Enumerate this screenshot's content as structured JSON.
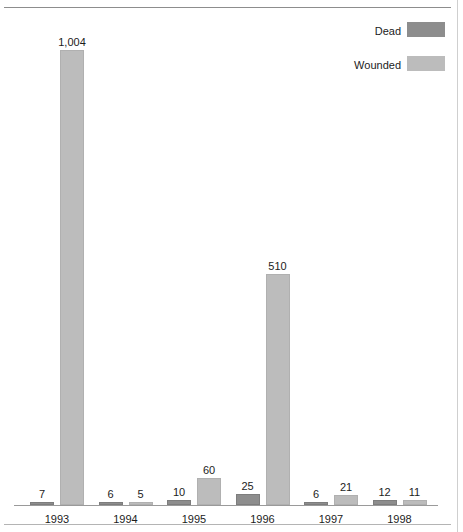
{
  "chart_data": {
    "type": "bar",
    "title": "",
    "xlabel": "",
    "ylabel": "",
    "grid": false,
    "legend_position": "top-right",
    "ylim": [
      0,
      1004
    ],
    "categories": [
      "1993",
      "1994",
      "1995",
      "1996",
      "1997",
      "1998"
    ],
    "series": [
      {
        "name": "Dead",
        "color": "#8d8d8d",
        "values": [
          7,
          6,
          10,
          25,
          6,
          12
        ],
        "labels": [
          "7",
          "6",
          "10",
          "25",
          "6",
          "12"
        ]
      },
      {
        "name": "Wounded",
        "color": "#bcbcbc",
        "values": [
          1004,
          5,
          60,
          510,
          21,
          11
        ],
        "labels": [
          "1,004",
          "5",
          "60",
          "510",
          "21",
          "11"
        ]
      }
    ]
  },
  "legend": {
    "items": [
      {
        "label": "Dead",
        "color": "#8d8d8d"
      },
      {
        "label": "Wounded",
        "color": "#bcbcbc"
      }
    ]
  }
}
